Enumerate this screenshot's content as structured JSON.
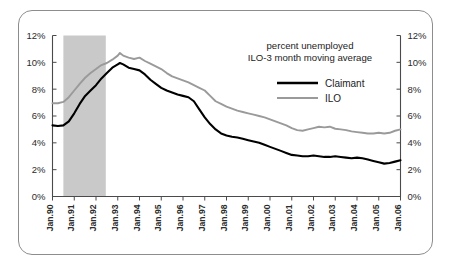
{
  "chart_data": {
    "type": "line",
    "title": "",
    "annotation_lines": [
      "percent unemployed",
      "ILO-3 month moving average"
    ],
    "xlabel": "",
    "ylabel": "",
    "ylim": [
      0,
      12
    ],
    "yticks": [
      0,
      2,
      4,
      6,
      8,
      10,
      12
    ],
    "ytick_labels": [
      "0%",
      "2%",
      "4%",
      "6%",
      "8%",
      "10%",
      "12%"
    ],
    "right_axis": true,
    "right_ytick_labels": [
      "0%",
      "2%",
      "4%",
      "6%",
      "8%",
      "10%",
      "12%"
    ],
    "grid": false,
    "legend_position": "upper-right",
    "xtick_labels": [
      "Jan.90",
      "Jan.91",
      "Jan.92",
      "Jan.93",
      "Jan.94",
      "Jan.95",
      "Jan.96",
      "Jan.97",
      "Jan.98",
      "Jan.99",
      "Jan.00",
      "Jan.01",
      "Jan.02",
      "Jan.03",
      "Jan.04",
      "Jan.05",
      "Jan.06"
    ],
    "xlim": [
      "Jan.90",
      "Jan.06"
    ],
    "shaded_region": {
      "label": "recession",
      "start": 1990.5,
      "end": 1992.45,
      "color": "#c9c9c9"
    },
    "colors": {
      "claimant": "#000000",
      "ilo": "#9a9a9a",
      "frame": "#8d8d8d",
      "axis": "#4a4a4a"
    },
    "series": [
      {
        "name": "Claimant",
        "color": "#000000",
        "x": [
          1990.0,
          1990.25,
          1990.5,
          1990.75,
          1991.0,
          1991.25,
          1991.5,
          1991.75,
          1992.0,
          1992.25,
          1992.5,
          1992.75,
          1993.0,
          1993.1,
          1993.25,
          1993.5,
          1993.75,
          1994.0,
          1994.25,
          1994.5,
          1994.75,
          1995.0,
          1995.25,
          1995.5,
          1995.75,
          1996.0,
          1996.25,
          1996.5,
          1996.75,
          1997.0,
          1997.25,
          1997.5,
          1997.75,
          1998.0,
          1998.25,
          1998.5,
          1998.75,
          1999.0,
          1999.25,
          1999.5,
          1999.75,
          2000.0,
          2000.25,
          2000.5,
          2000.75,
          2001.0,
          2001.25,
          2001.5,
          2001.75,
          2002.0,
          2002.25,
          2002.5,
          2002.75,
          2003.0,
          2003.25,
          2003.5,
          2003.75,
          2004.0,
          2004.25,
          2004.5,
          2004.75,
          2005.0,
          2005.25,
          2005.5,
          2005.75,
          2006.0
        ],
        "values": [
          5.3,
          5.25,
          5.3,
          5.6,
          6.2,
          6.9,
          7.5,
          7.9,
          8.3,
          8.8,
          9.2,
          9.6,
          9.85,
          9.95,
          9.85,
          9.6,
          9.5,
          9.4,
          9.1,
          8.7,
          8.4,
          8.1,
          7.9,
          7.75,
          7.6,
          7.5,
          7.4,
          7.1,
          6.5,
          5.9,
          5.4,
          5.0,
          4.7,
          4.55,
          4.45,
          4.4,
          4.3,
          4.2,
          4.1,
          4.0,
          3.85,
          3.7,
          3.55,
          3.4,
          3.25,
          3.1,
          3.05,
          3.0,
          3.0,
          3.05,
          3.0,
          2.95,
          2.95,
          3.0,
          2.95,
          2.9,
          2.85,
          2.9,
          2.85,
          2.75,
          2.65,
          2.55,
          2.45,
          2.5,
          2.6,
          2.7
        ]
      },
      {
        "name": "ILO",
        "color": "#9a9a9a",
        "x": [
          1990.0,
          1990.25,
          1990.5,
          1990.75,
          1991.0,
          1991.25,
          1991.5,
          1991.75,
          1992.0,
          1992.25,
          1992.5,
          1992.75,
          1993.0,
          1993.1,
          1993.25,
          1993.5,
          1993.75,
          1994.0,
          1994.25,
          1994.5,
          1994.75,
          1995.0,
          1995.25,
          1995.5,
          1995.75,
          1996.0,
          1996.25,
          1996.5,
          1996.75,
          1997.0,
          1997.25,
          1997.5,
          1997.75,
          1998.0,
          1998.25,
          1998.5,
          1998.75,
          1999.0,
          1999.25,
          1999.5,
          1999.75,
          2000.0,
          2000.25,
          2000.5,
          2000.75,
          2001.0,
          2001.25,
          2001.5,
          2001.75,
          2002.0,
          2002.25,
          2002.5,
          2002.75,
          2003.0,
          2003.25,
          2003.5,
          2003.75,
          2004.0,
          2004.25,
          2004.5,
          2004.75,
          2005.0,
          2005.25,
          2005.5,
          2005.75,
          2006.0
        ],
        "values": [
          6.95,
          6.95,
          7.05,
          7.4,
          7.9,
          8.4,
          8.85,
          9.2,
          9.5,
          9.8,
          9.95,
          10.2,
          10.5,
          10.7,
          10.5,
          10.35,
          10.25,
          10.35,
          10.1,
          9.9,
          9.7,
          9.5,
          9.2,
          8.95,
          8.8,
          8.65,
          8.5,
          8.3,
          8.1,
          7.9,
          7.5,
          7.1,
          6.9,
          6.7,
          6.55,
          6.4,
          6.3,
          6.2,
          6.1,
          6.0,
          5.9,
          5.75,
          5.6,
          5.45,
          5.3,
          5.1,
          4.95,
          4.9,
          5.0,
          5.1,
          5.2,
          5.15,
          5.2,
          5.05,
          5.0,
          4.95,
          4.85,
          4.8,
          4.75,
          4.7,
          4.7,
          4.75,
          4.7,
          4.75,
          4.9,
          5.0
        ]
      }
    ]
  },
  "legend": {
    "items": [
      {
        "label": "Claimant",
        "color": "#000000"
      },
      {
        "label": "ILO",
        "color": "#9a9a9a"
      }
    ]
  }
}
